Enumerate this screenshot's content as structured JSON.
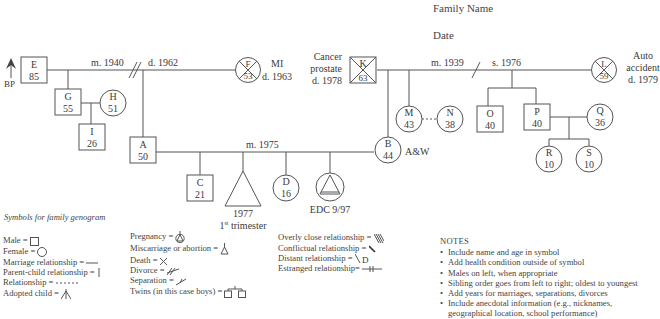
{
  "header": {
    "family_name_label": "Family Name",
    "date_label": "Date"
  },
  "people": {
    "E": {
      "letter": "E",
      "age": "85",
      "sex": "male",
      "note": "BP"
    },
    "F": {
      "letter": "F",
      "age": "53",
      "sex": "female",
      "deceased": true,
      "note_line1": "MI",
      "note_line2": "d. 1963"
    },
    "G": {
      "letter": "G",
      "age": "55",
      "sex": "male"
    },
    "H": {
      "letter": "H",
      "age": "51",
      "sex": "female"
    },
    "I": {
      "letter": "I",
      "age": "26",
      "sex": "male"
    },
    "A": {
      "letter": "A",
      "age": "50",
      "sex": "male"
    },
    "B": {
      "letter": "B",
      "age": "44",
      "sex": "female",
      "note": "A&W"
    },
    "C": {
      "letter": "C",
      "age": "21",
      "sex": "male"
    },
    "D": {
      "letter": "D",
      "age": "16",
      "sex": "female"
    },
    "K": {
      "letter": "K",
      "age": "63",
      "sex": "male",
      "deceased": true,
      "note_line1": "Cancer",
      "note_line2": "prostate",
      "note_line3": "d. 1978"
    },
    "L": {
      "letter": "L",
      "age": "59",
      "sex": "female",
      "deceased": true,
      "note_line1": "Auto",
      "note_line2": "accident",
      "note_line3": "d. 1979"
    },
    "M": {
      "letter": "M",
      "age": "43",
      "sex": "female"
    },
    "N": {
      "letter": "N",
      "age": "38",
      "sex": "female"
    },
    "O": {
      "letter": "O",
      "age": "40",
      "sex": "male"
    },
    "P": {
      "letter": "P",
      "age": "40",
      "sex": "male"
    },
    "Q": {
      "letter": "Q",
      "age": "36",
      "sex": "female"
    },
    "R": {
      "letter": "R",
      "age": "10",
      "sex": "female"
    },
    "S": {
      "letter": "S",
      "age": "10",
      "sex": "female"
    }
  },
  "relationships": {
    "EF": {
      "married": "m. 1940",
      "divorced": "d. 1962"
    },
    "KL": {
      "married": "m. 1939",
      "separated": "s. 1976"
    },
    "AB": {
      "married": "m. 1975"
    }
  },
  "pregnancies": {
    "miscarriage": {
      "line1": "1977",
      "line2_base": "1",
      "line2_sup": "st",
      "line2_rest": " trimester"
    },
    "current": {
      "label": "EDC 9/97"
    }
  },
  "legend": {
    "title": "Symbols for family genogram",
    "col1": [
      {
        "label": "Male = ",
        "icon": "square-icon"
      },
      {
        "label": "Female = ",
        "icon": "circle-icon"
      },
      {
        "label": "Marriage relationship = ",
        "icon": "hline-icon"
      },
      {
        "label": "Parent-child relationship = ",
        "icon": "vline-icon"
      },
      {
        "label": "Relationship = ",
        "icon": "dashed-line-icon"
      },
      {
        "label": "Adopted child = ",
        "icon": "adopted-arrow-icon"
      }
    ],
    "col2": [
      {
        "label": "Pregnancy = ",
        "icon": "pregnancy-icon"
      },
      {
        "label": "Miscarriage or abortion = ",
        "icon": "miscarriage-icon"
      },
      {
        "label": "Death = ",
        "icon": "x-icon"
      },
      {
        "label": "Divorce = ",
        "icon": "divorce-icon"
      },
      {
        "label": "Separation = ",
        "icon": "separation-icon"
      },
      {
        "label": "Twins (in this case boys) = ",
        "icon": "twins-icon"
      }
    ],
    "col3": [
      {
        "label": "Overly close relationship = ",
        "icon": "overly-close-icon"
      },
      {
        "label": "Conflictual relationship = ",
        "icon": "conflictual-icon"
      },
      {
        "label": "Distant relationship = ",
        "icon": "distant-icon"
      },
      {
        "label": "Estranged relationship= ",
        "icon": "estranged-icon"
      }
    ]
  },
  "notes": {
    "title": "NOTES",
    "items": [
      "Include name and age in symbol",
      "Add health condition outside of symbol",
      "Males on left, when appropriate",
      "Sibling order goes from left to right; oldest to youngest",
      "Add years for marriages, separations, divorces",
      "Include anecdotal information (e.g., nicknames,",
      "geographical location, school performance)"
    ]
  }
}
